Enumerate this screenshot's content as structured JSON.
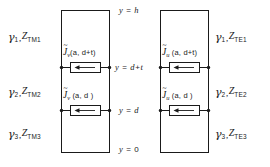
{
  "figure": {
    "type": "transmission-line-equivalent-circuit-diagram",
    "background_color": "#ffffff",
    "line_color": "#1a1a1a",
    "text_color": "#1a1a1a"
  },
  "axis_labels": [
    {
      "id": "y-h",
      "text": "y = h",
      "y_value": "h"
    },
    {
      "id": "y-dt",
      "text": "y = d+t",
      "y_value": "d+t"
    },
    {
      "id": "y-d",
      "text": "y = d",
      "y_value": "d"
    },
    {
      "id": "y-0",
      "text": "y = 0",
      "y_value": "0"
    }
  ],
  "networks": [
    {
      "id": "tm-network",
      "side": "left",
      "mode": "TM",
      "media": [
        {
          "index": "1",
          "gamma": "γ",
          "gamma_sub": "1",
          "impedance": "Z",
          "impedance_sub": "TM1",
          "label": "γ1 , ZTM1"
        },
        {
          "index": "2",
          "gamma": "γ",
          "gamma_sub": "2",
          "impedance": "Z",
          "impedance_sub": "TM2",
          "label": "γ2 , ZTM2"
        },
        {
          "index": "3",
          "gamma": "γ",
          "gamma_sub": "3",
          "impedance": "Z",
          "impedance_sub": "TM3",
          "label": "γ3 , ZTM3"
        }
      ],
      "sources": [
        {
          "id": "jv-upper",
          "symbol": "J",
          "tilde": "~",
          "sub": "v",
          "arg": "(a, d+t)",
          "at": "y = d+t",
          "arrow": "left"
        },
        {
          "id": "jv-lower",
          "symbol": "J",
          "tilde": "~",
          "sub": "v",
          "arg": "(a, d)",
          "at": "y = d",
          "arrow": "left"
        }
      ]
    },
    {
      "id": "te-network",
      "side": "right",
      "mode": "TE",
      "media": [
        {
          "index": "1",
          "gamma": "γ",
          "gamma_sub": "1",
          "impedance": "Z",
          "impedance_sub": "TE1",
          "label": "γ1 , ZTE1"
        },
        {
          "index": "2",
          "gamma": "γ",
          "gamma_sub": "2",
          "impedance": "Z",
          "impedance_sub": "TE2",
          "label": "γ2 , ZTE2"
        },
        {
          "index": "3",
          "gamma": "γ",
          "gamma_sub": "3",
          "impedance": "Z",
          "impedance_sub": "TE3",
          "label": "γ3 , ZTE3"
        }
      ],
      "sources": [
        {
          "id": "ju-upper",
          "symbol": "J",
          "tilde": "~",
          "sub": "u",
          "arg": "(a, d+t)",
          "at": "y = d+t",
          "arrow": "left"
        },
        {
          "id": "ju-lower",
          "symbol": "J",
          "tilde": "~",
          "sub": "u",
          "arg": "(a, d)",
          "at": "y = d",
          "arrow": "left"
        }
      ]
    }
  ],
  "symbols": {
    "equals": "=",
    "comma": ",",
    "tilde": "~",
    "arrow_left": "←"
  }
}
